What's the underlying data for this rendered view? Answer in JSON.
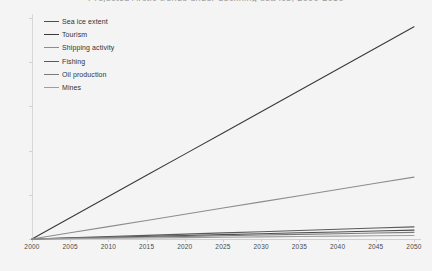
{
  "chart_data": {
    "type": "line",
    "title": "Projected Arctic trends under declining sea ice, 2000-2050",
    "xlabel": "",
    "ylabel": "",
    "grid": false,
    "legend_position": "upper-left",
    "x": [
      2000,
      2005,
      2010,
      2015,
      2020,
      2025,
      2030,
      2035,
      2040,
      2045,
      2050
    ],
    "xlim": [
      2000,
      2050
    ],
    "ylim": [
      0,
      100
    ],
    "x_tick_labels": [
      "2000",
      "2005",
      "2010",
      "2015",
      "2020",
      "2025",
      "2030",
      "2035",
      "2040",
      "2045",
      "2050"
    ],
    "y_tick_labels": [],
    "series": [
      {
        "name": "Sea ice extent",
        "color": "#4d4d4d",
        "values": [
          0,
          0.4,
          0.8,
          1.2,
          1.6,
          2.0,
          2.4,
          2.8,
          3.2,
          3.6,
          4.0
        ]
      },
      {
        "name": "Tourism",
        "color": "#3a3a3a",
        "values": [
          0,
          9.6,
          19.2,
          28.8,
          38.4,
          48.0,
          57.6,
          67.2,
          76.8,
          86.4,
          96.0
        ]
      },
      {
        "name": "Shipping activity",
        "color": "#8c8c8c",
        "values": [
          0,
          2.8,
          5.6,
          8.4,
          11.2,
          14.0,
          16.8,
          19.6,
          22.4,
          25.2,
          28.0
        ]
      },
      {
        "name": "Fishing",
        "color": "#5a5a5a",
        "values": [
          0,
          0.55,
          1.1,
          1.65,
          2.2,
          2.75,
          3.3,
          3.85,
          4.4,
          4.95,
          5.5
        ]
      },
      {
        "name": "Oil production",
        "color": "#7a7a7a",
        "values": [
          0,
          0.3,
          0.6,
          0.9,
          1.2,
          1.5,
          1.8,
          2.1,
          2.4,
          2.7,
          3.0
        ]
      },
      {
        "name": "Mines",
        "color": "#9e9e9e",
        "values": [
          0,
          0.16,
          0.32,
          0.48,
          0.64,
          0.8,
          0.96,
          1.12,
          1.28,
          1.44,
          1.6
        ]
      }
    ]
  }
}
